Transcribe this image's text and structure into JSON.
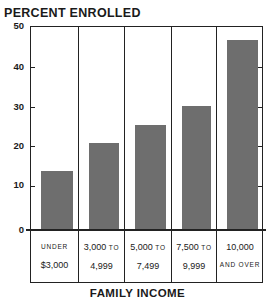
{
  "chart_data": {
    "type": "bar",
    "title": "PERCENT ENROLLED",
    "xlabel": "FAMILY INCOME",
    "ylabel": "PERCENT ENROLLED",
    "ylim": [
      0,
      50
    ],
    "yticks": [
      0,
      10,
      20,
      30,
      40,
      50
    ],
    "grid": false,
    "legend": null,
    "categories": [
      "UNDER $3,000",
      "3,000 TO 4,999",
      "5,000 TO 7,499",
      "7,500 TO 9,999",
      "10,000 AND OVER"
    ],
    "category_lines": [
      [
        "UNDER",
        "$3,000"
      ],
      [
        "3,000 TO",
        "4,999"
      ],
      [
        "5,000 TO",
        "7,499"
      ],
      [
        "7,500 TO",
        "9,999"
      ],
      [
        "10,000",
        "AND OVER"
      ]
    ],
    "values": [
      14.5,
      21.3,
      25.8,
      30.4,
      46.5
    ],
    "bar_color": "#6e6e6e"
  },
  "labels": {
    "title": "PERCENT ENROLLED",
    "xlabel": "FAMILY INCOME",
    "yticks": [
      "0",
      "10",
      "20",
      "30",
      "40",
      "50"
    ],
    "cats": [
      {
        "l1": "UNDER",
        "l2": "$3,000"
      },
      {
        "l1": "3,000 TO",
        "l2": "4,999"
      },
      {
        "l1": "5,000 TO",
        "l2": "7,499"
      },
      {
        "l1": "7,500 TO",
        "l2": "9,999"
      },
      {
        "l1": "10,000",
        "l2": "AND OVER"
      }
    ]
  }
}
